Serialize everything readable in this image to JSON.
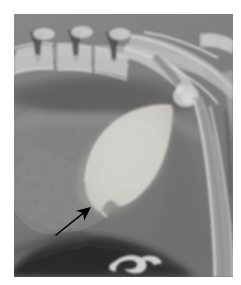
{
  "figure": {
    "type": "radiograph",
    "modality": "X-ray",
    "view": "lateral",
    "region": "caudal abdomen / pelvis",
    "background_color": "#ffffff",
    "plate": {
      "left": 14,
      "top": 14,
      "width": 219,
      "height": 263,
      "base_tone": "#7e7e7e"
    }
  },
  "colors": {
    "film_background": "#ffffff",
    "soft_tissue_mid": "#838383",
    "soft_tissue_dark": "#5e5e5e",
    "gas_dark": "#3a3a3a",
    "gas_black": "#141414",
    "bone_bright": "#e8e8e8",
    "bone_mid": "#c9c9c9",
    "contrast_bladder": "#ebe9e2",
    "contrast_bladder_edge": "#d8d6cd",
    "annotation_arrow": "#000000",
    "fat_light": "#9a9a9a"
  },
  "anatomy": {
    "vertebrae": {
      "label": "lumbar vertebrae",
      "count": 3,
      "spinous_process_label": "spinous process",
      "positions_x": [
        26,
        62,
        98
      ]
    },
    "sacrum": {
      "label": "sacrum"
    },
    "pelvis": {
      "label": "ilium / pelvic bone"
    },
    "femur": {
      "label": "femur"
    },
    "colon": {
      "label": "gas-filled colon"
    },
    "bladder": {
      "label": "contrast-filled urinary bladder",
      "shape": "leaf / teardrop",
      "center_x": 118,
      "center_y": 155
    },
    "os_penis": {
      "label": "os penis",
      "x": 120,
      "y": 258
    }
  },
  "annotations": [
    {
      "name": "arrow",
      "kind": "arrow-annotation",
      "points_to": "caudoventral bladder filling defect (notch)",
      "tail_x": 56,
      "tail_y": 235,
      "tip_x": 91,
      "tip_y": 207,
      "color": "#000000",
      "shaft_width": 1.6,
      "head_length": 14
    }
  ],
  "labels": {
    "title": "",
    "caption": ""
  }
}
